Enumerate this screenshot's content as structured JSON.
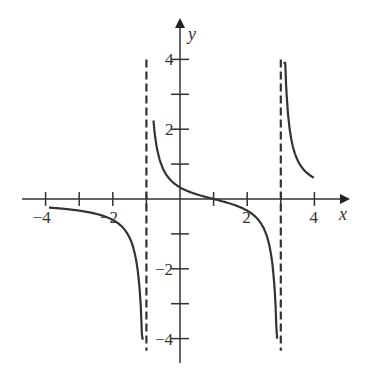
{
  "chart_data": {
    "type": "line",
    "title": "",
    "xlabel": "x",
    "ylabel": "y",
    "xlim": [
      -4.3,
      4.8
    ],
    "ylim": [
      -4.7,
      5.0
    ],
    "grid": false,
    "legend": null,
    "x_ticks": [
      -4,
      -3,
      -2,
      -1,
      1,
      2,
      3,
      4
    ],
    "x_tick_labels": [
      {
        "value": -4,
        "label": "−4"
      },
      {
        "value": -2,
        "label": "−2"
      },
      {
        "value": 2,
        "label": "2"
      },
      {
        "value": 4,
        "label": "4"
      }
    ],
    "y_ticks": [
      -4,
      -3,
      -2,
      -1,
      1,
      2,
      3,
      4
    ],
    "y_tick_labels": [
      {
        "value": 4,
        "label": "4"
      },
      {
        "value": 2,
        "label": "2"
      },
      {
        "value": -2,
        "label": "−2"
      },
      {
        "value": -4,
        "label": "−4"
      }
    ],
    "asymptotes": [
      {
        "type": "vertical",
        "x": -1,
        "style": "dashed"
      },
      {
        "type": "vertical",
        "x": 3,
        "style": "dashed"
      }
    ],
    "function_hint": "y = (x - 1) / ((x + 1)(x - 3))",
    "series": [
      {
        "name": "left-branch",
        "x": [
          -4,
          -3.5,
          -3,
          -2.5,
          -2,
          -1.5,
          -1.3,
          -1.2,
          -1.1
        ],
        "y": [
          -0.24,
          -0.3,
          -0.33,
          -0.44,
          -0.6,
          -1.11,
          -1.84,
          -2.62,
          -4.9
        ]
      },
      {
        "name": "middle-branch",
        "x": [
          -0.8,
          -0.6,
          -0.4,
          -0.2,
          0,
          0.5,
          1,
          1.5,
          2,
          2.5,
          2.7,
          2.8,
          2.9
        ],
        "y": [
          4.55,
          2.24,
          1.42,
          0.94,
          0.33,
          0.22,
          0,
          -0.2,
          -0.33,
          -0.43,
          -0.73,
          -0.73,
          -4.6
        ]
      },
      {
        "name": "right-branch",
        "x": [
          3.1,
          3.2,
          3.3,
          3.5,
          3.75,
          4
        ],
        "y": [
          5.1,
          2.6,
          1.8,
          1.11,
          0.8,
          0.6
        ]
      }
    ]
  },
  "axes": {
    "x_label": "x",
    "y_label": "y"
  },
  "style": {
    "curve_color": "#333333",
    "axis_color": "#333333",
    "asymptote_color": "#333333"
  }
}
